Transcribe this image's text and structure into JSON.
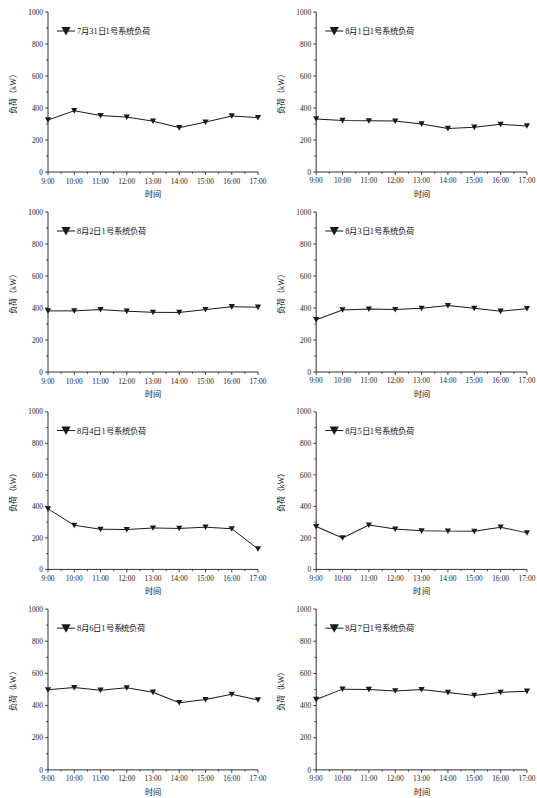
{
  "page": {
    "background": "#ffffff",
    "line_color": "#1a1a1a",
    "marker_shape": "triangle-down",
    "columns": 2,
    "rows": 4
  },
  "common": {
    "xlabel": "时间",
    "ylabel": "负荷（kW）",
    "xtick_labels": [
      "9:00",
      "10:00",
      "11:00",
      "12:00",
      "13:00",
      "14:00",
      "15:00",
      "16:00",
      "17:00"
    ],
    "ytick_labels": [
      "0",
      "200",
      "400",
      "600",
      "800",
      "1000"
    ],
    "ytick_values": [
      0,
      200,
      400,
      600,
      800,
      1000
    ],
    "ylim": [
      0,
      1000
    ],
    "legend_marker_icon": "triangle-down-icon"
  },
  "chart_data": [
    {
      "type": "line",
      "title": "",
      "legend": [
        "7月31日1号系统负荷"
      ],
      "xlabel": "时间",
      "ylabel": "负荷（kW）",
      "categories": [
        "9:00",
        "10:00",
        "11:00",
        "12:00",
        "13:00",
        "14:00",
        "15:00",
        "16:00",
        "17:00"
      ],
      "values": [
        325,
        383,
        353,
        343,
        318,
        277,
        312,
        350,
        340
      ],
      "ylim": [
        0,
        1000
      ],
      "grid": false,
      "legend_position": "top-left"
    },
    {
      "type": "line",
      "title": "",
      "legend": [
        "8月1日1号系统负荷"
      ],
      "xlabel": "时间",
      "ylabel": "负荷（kW）",
      "categories": [
        "9:00",
        "10:00",
        "11:00",
        "12:00",
        "13:00",
        "14:00",
        "15:00",
        "16:00",
        "17:00"
      ],
      "values": [
        332,
        322,
        320,
        318,
        300,
        272,
        280,
        298,
        288
      ],
      "ylim": [
        0,
        1000
      ],
      "grid": false,
      "legend_position": "top-left"
    },
    {
      "type": "line",
      "title": "",
      "legend": [
        "8月2日1号系统负荷"
      ],
      "xlabel": "时间",
      "ylabel": "负荷（kW）",
      "categories": [
        "9:00",
        "10:00",
        "11:00",
        "12:00",
        "13:00",
        "14:00",
        "15:00",
        "16:00",
        "17:00"
      ],
      "values": [
        382,
        382,
        390,
        380,
        373,
        372,
        390,
        408,
        405
      ],
      "ylim": [
        0,
        1000
      ],
      "grid": false,
      "legend_position": "top-left"
    },
    {
      "type": "line",
      "title": "",
      "legend": [
        "8月3日1号系统负荷"
      ],
      "xlabel": "时间",
      "ylabel": "负荷（kW）",
      "categories": [
        "9:00",
        "10:00",
        "11:00",
        "12:00",
        "13:00",
        "14:00",
        "15:00",
        "16:00",
        "17:00"
      ],
      "values": [
        327,
        388,
        393,
        390,
        398,
        415,
        398,
        380,
        396
      ],
      "ylim": [
        0,
        1000
      ],
      "grid": false,
      "legend_position": "top-left"
    },
    {
      "type": "line",
      "title": "",
      "legend": [
        "8月4日1号系统负荷"
      ],
      "xlabel": "时间",
      "ylabel": "负荷（kW）",
      "categories": [
        "9:00",
        "10:00",
        "11:00",
        "12:00",
        "13:00",
        "14:00",
        "15:00",
        "16:00",
        "17:00"
      ],
      "values": [
        385,
        280,
        255,
        253,
        263,
        260,
        268,
        258,
        130
      ],
      "ylim": [
        0,
        1000
      ],
      "grid": false,
      "legend_position": "top-left"
    },
    {
      "type": "line",
      "title": "",
      "legend": [
        "8月5日1号系统负荷"
      ],
      "xlabel": "时间",
      "ylabel": "负荷（kW）",
      "categories": [
        "9:00",
        "10:00",
        "11:00",
        "12:00",
        "13:00",
        "14:00",
        "15:00",
        "16:00",
        "17:00"
      ],
      "values": [
        272,
        200,
        282,
        256,
        245,
        243,
        242,
        268,
        232
      ],
      "ylim": [
        0,
        1000
      ],
      "grid": false,
      "legend_position": "top-left"
    },
    {
      "type": "line",
      "title": "",
      "legend": [
        "8月6日1号系统负荷"
      ],
      "xlabel": "时间",
      "ylabel": "负荷（kW）",
      "categories": [
        "9:00",
        "10:00",
        "11:00",
        "12:00",
        "13:00",
        "14:00",
        "15:00",
        "16:00",
        "17:00"
      ],
      "values": [
        498,
        512,
        495,
        510,
        483,
        418,
        437,
        470,
        435
      ],
      "ylim": [
        0,
        1000
      ],
      "grid": false,
      "legend_position": "top-left"
    },
    {
      "type": "line",
      "title": "",
      "legend": [
        "8月7日1号系统负荷"
      ],
      "xlabel": "时间",
      "ylabel": "负荷（kW）",
      "categories": [
        "9:00",
        "10:00",
        "11:00",
        "12:00",
        "13:00",
        "14:00",
        "15:00",
        "16:00",
        "17:00"
      ],
      "values": [
        438,
        502,
        500,
        491,
        499,
        481,
        463,
        482,
        489
      ],
      "ylim": [
        0,
        1000
      ],
      "grid": false,
      "legend_position": "top-left"
    }
  ]
}
